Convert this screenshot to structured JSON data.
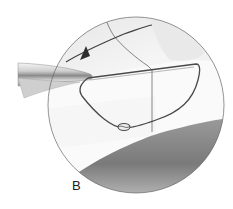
{
  "figure": {
    "panel_label": "B",
    "colors": {
      "background": "#ffffff",
      "outline": "#555555",
      "tissue_light": "#f2f2f2",
      "tissue_mid": "#d9d9d9",
      "tissue_dark": "#6e6e6e",
      "suture": "#4a4a4a",
      "instrument_light": "#e6e6e6",
      "instrument_dark": "#8a8a8a"
    }
  }
}
